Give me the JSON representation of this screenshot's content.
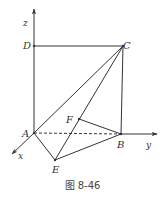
{
  "figure": {
    "caption": "图 8-46",
    "axes": {
      "x": {
        "label": "x",
        "from": [
          34,
          133
        ],
        "to": [
          12,
          154
        ]
      },
      "y": {
        "label": "y",
        "from": [
          121,
          134
        ],
        "to": [
          157,
          134
        ]
      },
      "z": {
        "label": "z",
        "from": [
          34,
          133
        ],
        "to": [
          34,
          9
        ]
      }
    },
    "points": {
      "A": {
        "label": "A",
        "x": 34,
        "y": 133
      },
      "B": {
        "label": "B",
        "x": 121,
        "y": 134
      },
      "C": {
        "label": "C",
        "x": 123,
        "y": 46
      },
      "D": {
        "label": "D",
        "x": 34,
        "y": 46
      },
      "E": {
        "label": "E",
        "x": 55,
        "y": 160
      },
      "F": {
        "label": "F",
        "x": 79,
        "y": 119
      }
    },
    "segments": [
      {
        "from": "D",
        "to": "C",
        "style": "solid"
      },
      {
        "from": "C",
        "to": "B",
        "style": "solid"
      },
      {
        "from": "A",
        "to": "C",
        "style": "solid"
      },
      {
        "from": "E",
        "to": "C",
        "style": "solid"
      },
      {
        "from": "A",
        "to": "E",
        "style": "solid"
      },
      {
        "from": "E",
        "to": "B",
        "style": "solid"
      },
      {
        "from": "F",
        "to": "B",
        "style": "solid"
      },
      {
        "from": "A",
        "to": "B",
        "style": "dashed"
      }
    ],
    "colors": {
      "line": "#333333",
      "text": "#333333"
    }
  }
}
